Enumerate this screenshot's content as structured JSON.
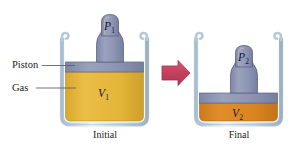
{
  "figure": {
    "background_color": "#ffffff"
  },
  "annotations": {
    "piston_label": "Piston",
    "gas_label": "Gas"
  },
  "panels": [
    {
      "id": "initial",
      "caption": "Initial",
      "pressure_label": "P",
      "pressure_subscript": "1",
      "volume_label": "V",
      "volume_subscript": "1",
      "gas_color": "#e4b63a",
      "piston_color": "#8e96b4"
    },
    {
      "id": "final",
      "caption": "Final",
      "pressure_label": "P",
      "pressure_subscript": "2",
      "volume_label": "V",
      "volume_subscript": "2",
      "gas_color": "#da8523",
      "piston_color": "#8e96b4"
    }
  ],
  "arrow": {
    "name": "process-arrow",
    "direction": "right",
    "color": "#c6425f"
  },
  "colors": {
    "glass_fill": "#c9d8e4",
    "glass_stroke": "#8fa3b4",
    "piston_fill": "#8e96b4",
    "piston_stroke": "#5d6480",
    "gas_initial": "#e4b63a",
    "gas_final": "#da8523",
    "arrow_fill": "#c6425f",
    "arrow_stroke": "#a32f49",
    "leader_line": "#5b6470",
    "text": "#1b1b1b"
  }
}
